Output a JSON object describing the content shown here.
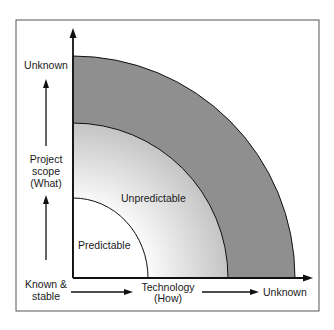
{
  "diagram": {
    "y_axis": {
      "top_label": "Unknown",
      "middle_label_line1": "Project",
      "middle_label_line2": "scope",
      "middle_label_line3": "(What)",
      "bottom_label_line1": "Known &",
      "bottom_label_line2": "stable"
    },
    "x_axis": {
      "label_line1": "Technology",
      "label_line2": "(How)",
      "right_label": "Unknown"
    },
    "regions": {
      "inner": "Predictable",
      "middle": "Unpredictable",
      "outer": ""
    },
    "colors": {
      "outer_band": "#8f8f8f",
      "middle_band_edge": "#c8c8c8",
      "middle_band_center": "#f4f4f4",
      "inner": "#ffffff",
      "stroke": "#111111",
      "frame": "#555555"
    }
  }
}
